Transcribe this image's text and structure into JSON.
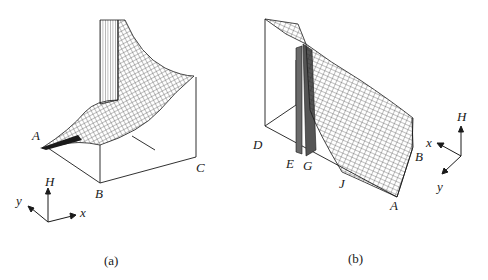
{
  "figure": {
    "panels": [
      {
        "id": "a",
        "caption": "(a)",
        "corner_labels": {
          "A": "A",
          "B": "B",
          "C": "C"
        },
        "axes": {
          "vertical": "H",
          "horizontal": "x",
          "depth": "y"
        },
        "plot_type": "3D wireframe surface"
      },
      {
        "id": "b",
        "caption": "(b)",
        "corner_labels": {
          "D": "D",
          "E": "E",
          "G": "G",
          "J": "J",
          "A": "A",
          "B": "B"
        },
        "axes": {
          "vertical": "H",
          "horizontal": "x",
          "depth": "y"
        },
        "plot_type": "3D wireframe surface"
      }
    ],
    "colors": {
      "ink": "#1a1a1a",
      "mesh": "#2a2a2a",
      "wall": "#555555",
      "background": "#ffffff"
    }
  }
}
